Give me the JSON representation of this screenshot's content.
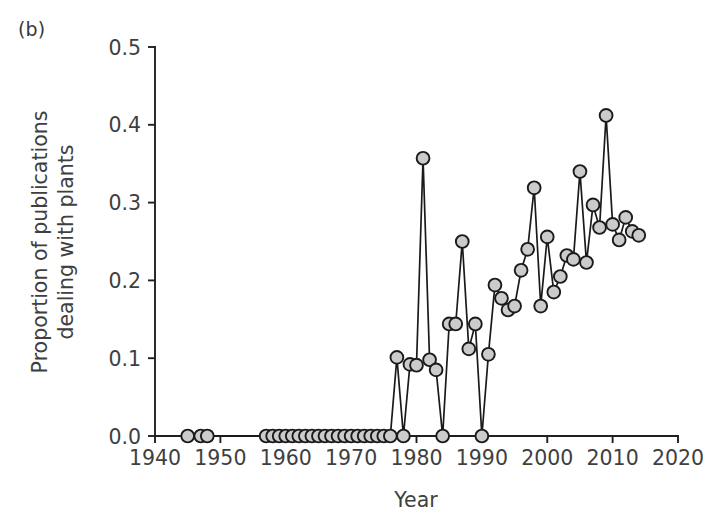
{
  "figure": {
    "panel_label": "(b)",
    "background_color": "#ffffff",
    "text_color": "#3f3f3f",
    "line_color": "#1a1a1a",
    "marker_fill_color": "#cbcbcb"
  },
  "chart_data": {
    "type": "line",
    "title": "",
    "subtitle": "",
    "xlabel": "Year",
    "ylabel": "Proportion of publications dealing with plants",
    "ylabel_line1": "Proportion of publications",
    "ylabel_line2": "dealing with plants",
    "xlim": [
      1940,
      2020
    ],
    "ylim": [
      0.0,
      0.5
    ],
    "xticks": [
      1940,
      1950,
      1960,
      1970,
      1980,
      1990,
      2000,
      2010,
      2020
    ],
    "xtick_labels": [
      "1940",
      "1950",
      "1960",
      "1970",
      "1980",
      "1990",
      "2000",
      "2010",
      "2020"
    ],
    "yticks": [
      0.0,
      0.1,
      0.2,
      0.3,
      0.4,
      0.5
    ],
    "ytick_labels": [
      "0.0",
      "0.1",
      "0.2",
      "0.3",
      "0.4",
      "0.5"
    ],
    "grid": false,
    "legend": null,
    "legend_position": "none",
    "marker": "filled-circle",
    "series": [
      {
        "name": "Proportion of publications dealing with plants",
        "x": [
          1945,
          1947,
          1948,
          1957,
          1958,
          1959,
          1960,
          1961,
          1962,
          1963,
          1964,
          1965,
          1966,
          1967,
          1968,
          1969,
          1970,
          1971,
          1972,
          1973,
          1974,
          1975,
          1976,
          1977,
          1978,
          1979,
          1980,
          1981,
          1982,
          1983,
          1984,
          1985,
          1986,
          1987,
          1988,
          1989,
          1990,
          1991,
          1992,
          1993,
          1994,
          1995,
          1996,
          1997,
          1998,
          1999,
          2000,
          2001,
          2002,
          2003,
          2004,
          2005,
          2006,
          2007,
          2008,
          2009,
          2010,
          2011,
          2012,
          2013,
          2014
        ],
        "y": [
          0.0,
          0.0,
          0.0,
          0.0,
          0.0,
          0.0,
          0.0,
          0.0,
          0.0,
          0.0,
          0.0,
          0.0,
          0.0,
          0.0,
          0.0,
          0.0,
          0.0,
          0.0,
          0.0,
          0.0,
          0.0,
          0.0,
          0.0,
          0.101,
          0.0,
          0.092,
          0.091,
          0.357,
          0.098,
          0.085,
          0.0,
          0.144,
          0.144,
          0.25,
          0.112,
          0.144,
          0.0,
          0.105,
          0.194,
          0.177,
          0.162,
          0.167,
          0.213,
          0.24,
          0.319,
          0.167,
          0.256,
          0.185,
          0.205,
          0.232,
          0.227,
          0.34,
          0.223,
          0.297,
          0.268,
          0.412,
          0.272,
          0.252,
          0.281,
          0.263,
          0.258
        ]
      }
    ]
  },
  "axes_geometry": {
    "plot_left_px": 155,
    "plot_right_px": 678,
    "plot_top_px": 47,
    "plot_bottom_px": 436
  }
}
